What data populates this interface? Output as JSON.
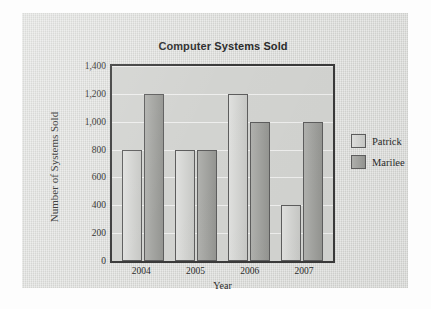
{
  "chart_data": {
    "type": "bar",
    "title": "Computer Systems Sold",
    "xlabel": "Year",
    "ylabel": "Number of Systems Sold",
    "categories": [
      "2004",
      "2005",
      "2006",
      "2007"
    ],
    "series": [
      {
        "name": "Patrick",
        "values": [
          800,
          800,
          1200,
          400
        ],
        "color": "#cfd0cd"
      },
      {
        "name": "Marilee",
        "values": [
          1200,
          800,
          1000,
          1000
        ],
        "color": "#9fa09c"
      }
    ],
    "ylim": [
      0,
      1400
    ],
    "ytick_values": [
      0,
      200,
      400,
      600,
      800,
      1000,
      1200,
      1400
    ],
    "ytick_labels": [
      "0",
      "200",
      "400",
      "600",
      "800",
      "1,000",
      "1,200",
      "1,400"
    ],
    "grid": true,
    "legend_position": "right",
    "plot_background": "#d2d3d0",
    "page_background": "#d9dad7"
  }
}
